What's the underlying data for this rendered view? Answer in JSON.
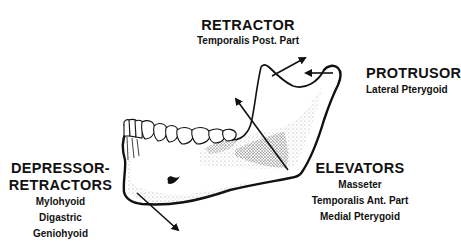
{
  "diagram": {
    "colors": {
      "ink": "#111111",
      "background": "#ffffff",
      "stipple": "#555555"
    },
    "groups": [
      {
        "id": "retractor",
        "title": "RETRACTOR",
        "muscles": [
          "Temporalis Post. Part"
        ]
      },
      {
        "id": "protrusor",
        "title": "PROTRUSOR",
        "muscles": [
          "Lateral Pterygoid"
        ]
      },
      {
        "id": "depressor-retractors",
        "title_line1": "DEPRESSOR-",
        "title_line2": "RETRACTORS",
        "muscles": [
          "Mylohyoid",
          "Digastric",
          "Geniohyoid"
        ]
      },
      {
        "id": "elevators",
        "title": "ELEVATORS",
        "muscles": [
          "Masseter",
          "Temporalis Ant. Part",
          "Medial Pterygoid"
        ]
      }
    ],
    "arrows": [
      {
        "name": "retractor-arrow",
        "direction": "up-right",
        "from": [
          272,
          76
        ],
        "to": [
          305,
          58
        ]
      },
      {
        "name": "protrusor-arrow",
        "direction": "left",
        "from": [
          333,
          73
        ],
        "to": [
          305,
          73
        ]
      },
      {
        "name": "elevator-arrow",
        "direction": "up-left",
        "from": [
          288,
          170
        ],
        "to": [
          236,
          100
        ]
      },
      {
        "name": "depressor-arrow",
        "direction": "down-right",
        "from": [
          138,
          193
        ],
        "to": [
          178,
          230
        ]
      }
    ]
  }
}
